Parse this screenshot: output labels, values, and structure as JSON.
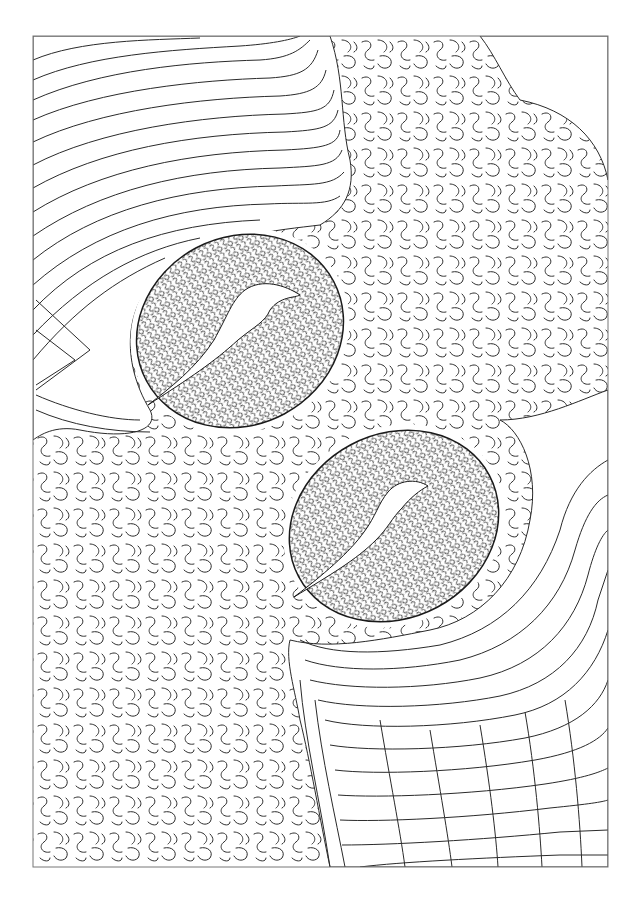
{
  "artwork": {
    "description": "Maze-style line drawing of two coffee beans",
    "background": "#ffffff",
    "ink": "#2a2a2a",
    "frame": {
      "x": 33,
      "y": 36,
      "w": 575,
      "h": 831,
      "stroke": "#777777"
    },
    "beans": [
      {
        "cx": 240,
        "cy": 331,
        "rx": 108,
        "ry": 96,
        "rotate": -28,
        "slit": "M148,405 C190,378 214,362 238,340 C255,326 265,322 270,310 C280,296 295,298 300,295 C285,285 262,278 245,290 C232,300 228,315 214,340 C196,368 170,388 148,405 Z"
      },
      {
        "cx": 394,
        "cy": 526,
        "rx": 110,
        "ry": 94,
        "rotate": -28,
        "slit": "M294,597 C330,575 356,560 376,540 C388,528 392,518 402,508 C410,498 420,490 428,486 C416,478 398,480 388,492 C378,504 376,516 364,532 C350,552 322,576 294,597 Z"
      }
    ],
    "blank_corner": {
      "path": "M480,36 L608,36 L608,180 C600,140 570,110 520,100 C505,80 495,55 480,36 Z"
    },
    "regions": {
      "top_left_streamlines": "parallel curved lines sweeping around upper bean",
      "center_maze": "coarse meandering maze texture",
      "bottom_right_streamlines": "parallel curved lines sweeping around lower bean",
      "bean_fill": "dense fine maze texture"
    }
  }
}
